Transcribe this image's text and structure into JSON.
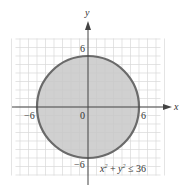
{
  "chart_data": {
    "type": "area",
    "title": "",
    "xlabel": "x",
    "ylabel": "y",
    "xlim": [
      -9,
      9
    ],
    "ylim": [
      -9,
      9
    ],
    "grid": true,
    "grid_step": 1,
    "tick_labels": {
      "x": [
        {
          "value": -6,
          "label": "−6"
        },
        {
          "value": 0,
          "label": "0"
        },
        {
          "value": 6,
          "label": "6"
        }
      ],
      "y": [
        {
          "value": 6,
          "label": "6"
        },
        {
          "value": -6,
          "label": "−6"
        }
      ]
    },
    "series": [
      {
        "name": "x^2 + y^2 ≤ 36",
        "shape": "circle",
        "center": [
          0,
          0
        ],
        "radius": 6,
        "fill": "shaded interior",
        "boundary": "solid"
      }
    ],
    "annotations": [
      {
        "text": "x² + y² ≤ 36",
        "position": [
          3.5,
          -7.5
        ]
      }
    ],
    "legend": "none"
  },
  "labels": {
    "x_axis": "x",
    "y_axis": "y",
    "tick_x_neg6": "−6",
    "tick_origin": "0",
    "tick_x_6": "6",
    "tick_y_6": "6",
    "tick_y_neg6": "−6"
  },
  "colors": {
    "fill": "#c8c8c8",
    "boundary": "#6a6a6a",
    "grid": "#d9d9d9",
    "axis": "#444444"
  }
}
